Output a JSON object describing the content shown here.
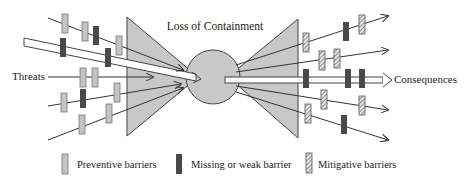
{
  "diagram": {
    "title": "Loss of Containment",
    "left_label": "Threats",
    "right_label": "Consequences",
    "colors": {
      "triangle_fill": "#c8c8c8",
      "circle_fill": "#c8c8c8",
      "preventive": "#c4c4c4",
      "missing": "#4a4a4a",
      "mitigative_bg": "#e0e0e0",
      "line": "#333333"
    }
  },
  "legend": {
    "items": [
      {
        "label": "Preventive barriers",
        "type": "preventive"
      },
      {
        "label": "Missing or weak barrier",
        "type": "missing"
      },
      {
        "label": "Mitigative barriers",
        "type": "mitigative"
      }
    ]
  },
  "threat_lines": [
    {
      "x1": 48,
      "y1": 18,
      "x2": 183,
      "y2": 70,
      "barriers": [
        {
          "x": 65,
          "y": 14,
          "type": "preventive"
        },
        {
          "x": 85,
          "y": 22,
          "type": "preventive"
        },
        {
          "x": 96,
          "y": 26,
          "type": "missing"
        },
        {
          "x": 119,
          "y": 36,
          "type": "preventive"
        }
      ]
    },
    {
      "x1": 48,
      "y1": 77,
      "x2": 153,
      "y2": 77,
      "barriers": [
        {
          "x": 83,
          "y": 68,
          "type": "preventive"
        },
        {
          "x": 95,
          "y": 68,
          "type": "preventive"
        }
      ]
    },
    {
      "x1": 48,
      "y1": 106,
      "x2": 181,
      "y2": 84,
      "barriers": [
        {
          "x": 64,
          "y": 93,
          "type": "preventive"
        },
        {
          "x": 83,
          "y": 89,
          "type": "missing"
        },
        {
          "x": 117,
          "y": 83,
          "type": "preventive"
        }
      ]
    },
    {
      "x1": 48,
      "y1": 140,
      "x2": 183,
      "y2": 88,
      "barriers": [
        {
          "x": 82,
          "y": 115,
          "type": "preventive"
        },
        {
          "x": 109,
          "y": 104,
          "type": "preventive"
        }
      ]
    }
  ],
  "main_threat_path": {
    "barriers": [
      {
        "x": 63,
        "y": 38,
        "type": "missing"
      },
      {
        "x": 108,
        "y": 48,
        "type": "missing"
      }
    ]
  },
  "consequence_lines": [
    {
      "x1": 236,
      "y1": 65,
      "x2": 388,
      "y2": 16,
      "barriers": [
        {
          "x": 306,
          "y": 33,
          "type": "mitigative"
        },
        {
          "x": 346,
          "y": 22,
          "type": "missing"
        },
        {
          "x": 362,
          "y": 15,
          "type": "mitigative"
        }
      ]
    },
    {
      "x1": 236,
      "y1": 72,
      "x2": 388,
      "y2": 50,
      "barriers": [
        {
          "x": 322,
          "y": 51,
          "type": "mitigative"
        },
        {
          "x": 337,
          "y": 49,
          "type": "mitigative"
        }
      ]
    },
    {
      "x1": 236,
      "y1": 86,
      "x2": 388,
      "y2": 110,
      "barriers": [
        {
          "x": 324,
          "y": 90,
          "type": "mitigative"
        },
        {
          "x": 362,
          "y": 96,
          "type": "mitigative"
        }
      ]
    },
    {
      "x1": 236,
      "y1": 92,
      "x2": 388,
      "y2": 140,
      "barriers": [
        {
          "x": 308,
          "y": 104,
          "type": "mitigative"
        },
        {
          "x": 344,
          "y": 115,
          "type": "missing"
        }
      ]
    }
  ],
  "main_consequence_path": {
    "barriers": [
      {
        "x": 306,
        "y": 69,
        "type": "missing"
      },
      {
        "x": 348,
        "y": 69,
        "type": "missing"
      },
      {
        "x": 362,
        "y": 69,
        "type": "missing"
      }
    ]
  }
}
